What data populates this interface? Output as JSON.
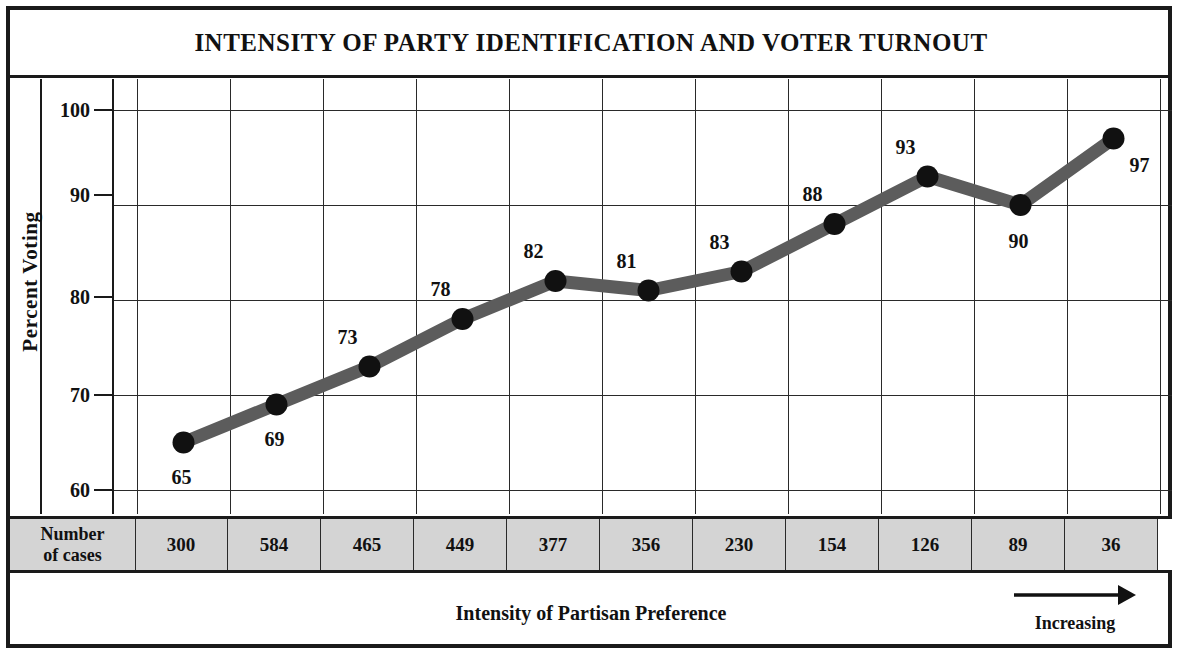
{
  "chart_data": {
    "type": "line",
    "title": "INTENSITY OF PARTY IDENTIFICATION AND VOTER TURNOUT",
    "xlabel": "Intensity of Partisan Preference",
    "ylabel": "Percent Voting",
    "ylim": [
      60,
      100
    ],
    "yticks": [
      100,
      90,
      80,
      70,
      60
    ],
    "grid": true,
    "legend": "none",
    "categories": [
      "1",
      "2",
      "3",
      "4",
      "5",
      "6",
      "7",
      "8",
      "9",
      "10",
      "11"
    ],
    "values": [
      65,
      69,
      73,
      78,
      82,
      81,
      83,
      88,
      93,
      90,
      97
    ],
    "point_labels": [
      "65",
      "69",
      "73",
      "78",
      "82",
      "81",
      "83",
      "88",
      "93",
      "90",
      "97"
    ],
    "number_of_cases": [
      300,
      584,
      465,
      449,
      377,
      356,
      230,
      154,
      126,
      89,
      36
    ],
    "cases_row_header": "Number\nof cases",
    "direction_annotation": "Increasing",
    "direction_arrow": "right-arrow-icon",
    "line_color": "#5c5c5c",
    "marker_color": "#111111",
    "grid_color": "#2a2a2a",
    "frame_color": "#1a1a1a",
    "cases_row_fill": "#d4d4d4"
  },
  "title": {
    "text": "INTENSITY OF PARTY IDENTIFICATION AND VOTER TURNOUT"
  },
  "axes": {
    "y_title": "Percent Voting",
    "y_ticks": [
      "100",
      "90",
      "80",
      "70",
      "60"
    ],
    "x_caption": "Intensity of Partisan Preference"
  },
  "cases_table": {
    "header_line1": "Number",
    "header_line2": "of cases",
    "values": [
      "300",
      "584",
      "465",
      "449",
      "377",
      "356",
      "230",
      "154",
      "126",
      "89",
      "36"
    ]
  },
  "annotation": {
    "increasing": "Increasing"
  }
}
